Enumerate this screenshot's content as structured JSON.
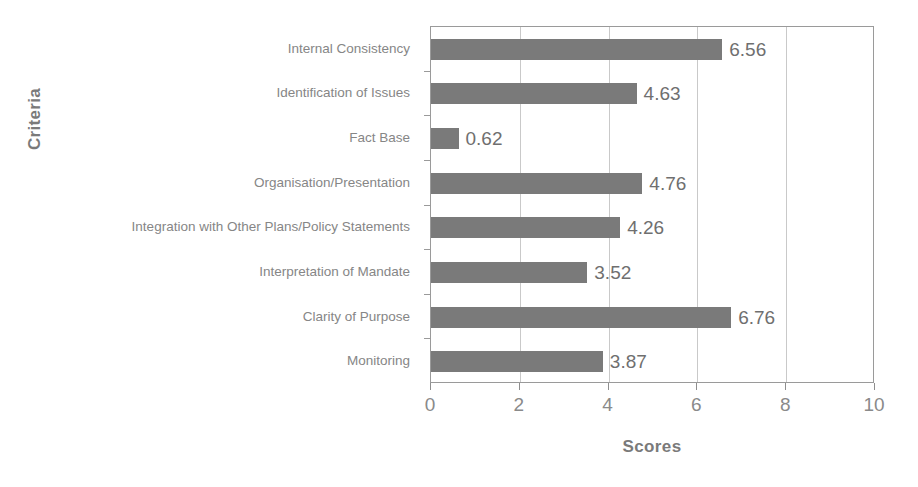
{
  "chart_data": {
    "type": "bar",
    "orientation": "horizontal",
    "title": "",
    "xlabel": "Scores",
    "ylabel": "Criteria",
    "xlim": [
      0,
      10
    ],
    "xticks": [
      0,
      2,
      4,
      6,
      8,
      10
    ],
    "grid": true,
    "legend": false,
    "bar_color": "#7a7a7a",
    "categories": [
      "Internal Consistency",
      "Identification of Issues",
      "Fact Base",
      "Organisation/Presentation",
      "Integration with Other Plans/Policy Statements",
      "Interpretation of Mandate",
      "Clarity of Purpose",
      "Monitoring"
    ],
    "values": [
      6.56,
      4.63,
      0.62,
      4.76,
      4.26,
      3.52,
      6.76,
      3.87
    ],
    "value_labels": [
      "6.56",
      "4.63",
      "0.62",
      "4.76",
      "4.26",
      "3.52",
      "6.76",
      "3.87"
    ]
  }
}
